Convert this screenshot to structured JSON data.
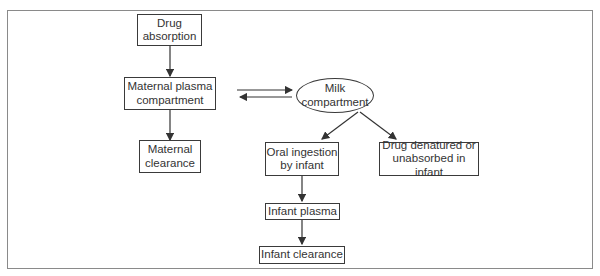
{
  "diagram": {
    "nodes": {
      "drug_absorption": "Drug\nabsorption",
      "maternal_plasma": "Maternal plasma\ncompartment",
      "maternal_clearance": "Maternal\nclearance",
      "milk_compartment": "Milk\ncompartment",
      "oral_ingestion": "Oral ingestion\nby infant",
      "drug_denatured": "Drug denatured or\nunabsorbed in infant",
      "infant_plasma": "Infant plasma",
      "infant_clearance": "Infant clearance"
    },
    "edges": [
      {
        "from": "drug_absorption",
        "to": "maternal_plasma"
      },
      {
        "from": "maternal_plasma",
        "to": "maternal_clearance"
      },
      {
        "from": "maternal_plasma",
        "to": "milk_compartment",
        "bidirectional": true
      },
      {
        "from": "milk_compartment",
        "to": "oral_ingestion"
      },
      {
        "from": "milk_compartment",
        "to": "drug_denatured"
      },
      {
        "from": "oral_ingestion",
        "to": "infant_plasma"
      },
      {
        "from": "infant_plasma",
        "to": "infant_clearance"
      }
    ],
    "colors": {
      "line": "#333333",
      "frame": "#8a8a8a",
      "background": "#ffffff"
    }
  }
}
